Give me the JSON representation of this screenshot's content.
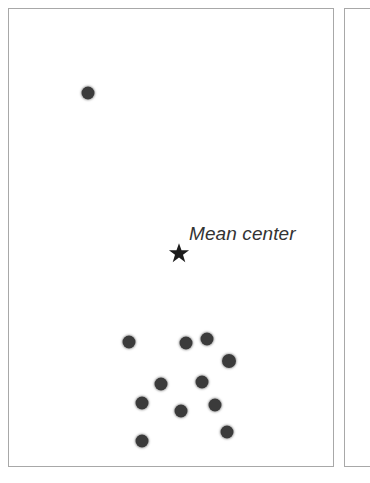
{
  "figure": {
    "width": 348,
    "height": 483,
    "background_color": "#ffffff"
  },
  "panels": {
    "main": {
      "name": "main-panel",
      "border_color": "#a8a8a8",
      "fill_color": "#ffffff",
      "x": 8,
      "y": 8,
      "width": 326,
      "height": 459
    },
    "neighbor": {
      "name": "adjacent-panel-sliver",
      "border_color": "#a8a8a8",
      "fill_color": "#ffffff",
      "x": 344,
      "y": 8,
      "width": 26,
      "height": 459
    }
  },
  "annotations": {
    "mean_center_label": {
      "text": "Mean center",
      "x": 180,
      "y": 214,
      "font_size": 19,
      "font_style": "italic",
      "color": "#333333"
    },
    "mean_center_marker": {
      "icon": "star-icon",
      "x": 170,
      "y": 244,
      "size": 21,
      "color": "#1c1c1c"
    }
  },
  "chart_data": {
    "type": "scatter",
    "title": "",
    "subtitle": "",
    "xlabel": "",
    "ylabel": "",
    "xlim": [
      0,
      324
    ],
    "ylim": [
      0,
      457
    ],
    "grid": false,
    "legend": null,
    "axes_visible": false,
    "tick_labels": {
      "x": [],
      "y": []
    },
    "point_style": {
      "marker": "circle",
      "color": "#3b3b3b",
      "halo_color": "#787878",
      "diameter": 13
    },
    "series": [
      {
        "name": "Observations",
        "marker": "circle",
        "color": "#3b3b3b",
        "count": 13,
        "points": [
          {
            "id": "p1",
            "x": 79,
            "y": 84,
            "d": 13,
            "group": "outlier"
          },
          {
            "id": "p2",
            "x": 120,
            "y": 333,
            "d": 13,
            "group": "cluster"
          },
          {
            "id": "p3",
            "x": 177,
            "y": 334,
            "d": 13,
            "group": "cluster"
          },
          {
            "id": "p4",
            "x": 198,
            "y": 330,
            "d": 13,
            "group": "cluster"
          },
          {
            "id": "p5",
            "x": 220,
            "y": 352,
            "d": 14,
            "group": "cluster"
          },
          {
            "id": "p6",
            "x": 152,
            "y": 375,
            "d": 13,
            "group": "cluster"
          },
          {
            "id": "p7",
            "x": 193,
            "y": 373,
            "d": 13,
            "group": "cluster"
          },
          {
            "id": "p8",
            "x": 133,
            "y": 394,
            "d": 13,
            "group": "cluster"
          },
          {
            "id": "p9",
            "x": 206,
            "y": 396,
            "d": 13,
            "group": "cluster"
          },
          {
            "id": "p10",
            "x": 172,
            "y": 402,
            "d": 13,
            "group": "cluster"
          },
          {
            "id": "p11",
            "x": 218,
            "y": 423,
            "d": 13,
            "group": "cluster"
          },
          {
            "id": "p12",
            "x": 133,
            "y": 432,
            "d": 13,
            "group": "cluster"
          },
          {
            "id": "p13",
            "x": 216,
            "y": 370,
            "d": 0,
            "group": "hidden"
          }
        ]
      },
      {
        "name": "Mean center",
        "marker": "star",
        "color": "#1c1c1c",
        "count": 1,
        "points": [
          {
            "id": "mean",
            "x": 170,
            "y": 244,
            "d": 21,
            "group": "mean"
          }
        ]
      }
    ],
    "annotations": [
      {
        "text": "Mean center",
        "x": 180,
        "y": 224,
        "style": "italic"
      }
    ]
  }
}
